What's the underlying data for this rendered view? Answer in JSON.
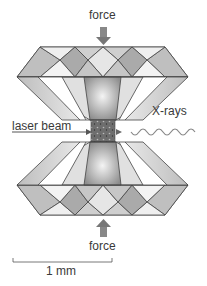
{
  "diagram": {
    "labels": {
      "force_top": "force",
      "force_bottom": "force",
      "laser": "laser beam",
      "xrays": "X-rays",
      "scale": "1 mm"
    },
    "colors": {
      "diamond_face": "#d6d6d6",
      "diamond_dark": "#9a9a9a",
      "diamond_light": "#f2f2f2",
      "edge": "#444444",
      "arrow": "#7a7a7a",
      "sample": "#6e6e6e"
    }
  }
}
